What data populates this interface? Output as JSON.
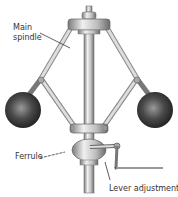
{
  "diagram": {
    "labels": {
      "main_spindle_line1": "Main",
      "main_spindle_line2": "spindle",
      "ferrule": "Ferrule",
      "lever_adjustment": "Lever adjustment"
    },
    "colors": {
      "metal_light": "#e6e6e6",
      "metal_mid": "#b4b4b4",
      "metal_dark": "#6e6e6e",
      "ball_dark": "#2a2a2a",
      "ball_light": "#8a8a8a",
      "text": "#333333"
    }
  }
}
